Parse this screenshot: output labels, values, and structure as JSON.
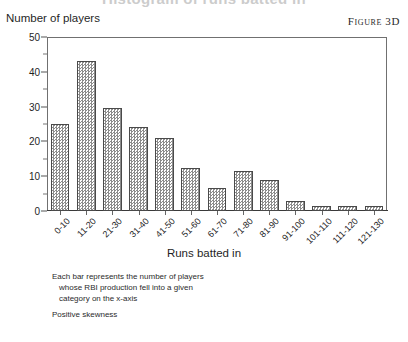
{
  "figure": {
    "cropped_title": "Histogram of runs batted in",
    "label": "Figure 3D"
  },
  "axes": {
    "y_title": "Number of players",
    "x_title": "Runs batted in",
    "y_ticks": [
      "0",
      "10",
      "20",
      "30",
      "40",
      "50"
    ],
    "y_minor_ticks": [
      "5",
      "15",
      "25",
      "35",
      "45"
    ]
  },
  "annotation": {
    "line1": "Each bar represents the number of players",
    "line2": "whose RBI production fell into a given",
    "line3": "category on the x-axis",
    "skewness": "Positive skewness"
  },
  "colors": {
    "bar_fill": "#8c8c8c",
    "bar_border": "#4a4a4a",
    "frame": "#707070",
    "text": "#1f1f1f"
  },
  "chart_data": {
    "type": "bar",
    "title": "Histogram of runs batted in",
    "xlabel": "Runs batted in",
    "ylabel": "Number of players",
    "ylim": [
      0,
      50
    ],
    "ytick_step": 10,
    "yminor_step": 5,
    "grid": false,
    "legend": null,
    "categories": [
      "0-10",
      "11-20",
      "21-30",
      "31-40",
      "41-50",
      "51-60",
      "61-70",
      "71-80",
      "81-90",
      "91-100",
      "101-110",
      "111-120",
      "121-130"
    ],
    "values": [
      25,
      43,
      29.5,
      24,
      21,
      12.5,
      6.5,
      11.5,
      9,
      3,
      1.5,
      1.5,
      1.5
    ],
    "annotations": [
      "Each bar represents the number of players whose RBI production fell into a given category on the x-axis",
      "Positive skewness"
    ]
  }
}
